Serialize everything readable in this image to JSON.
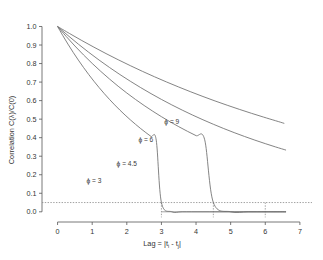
{
  "chart_data": {
    "type": "line",
    "title": "",
    "xlabel": "Lag = |t i - t j|",
    "xlabel_parts": {
      "lead": "Lag = |t",
      "sub1": "i",
      "mid": " - t",
      "sub2": "j",
      "tail": "|"
    },
    "ylabel": "Correlation C(λ)/C(0)",
    "xlim": [
      -0.45,
      7.35
    ],
    "ylim": [
      -0.055,
      1.035
    ],
    "xticks": [
      0,
      1,
      2,
      3,
      4,
      5,
      6,
      7
    ],
    "xtick_labels": [
      "0",
      "1",
      "2",
      "3",
      "4",
      "5",
      "6",
      "7"
    ],
    "yticks": [
      0.0,
      0.1,
      0.2,
      0.3,
      0.4,
      0.5,
      0.6,
      0.7,
      0.8,
      0.9,
      1.0
    ],
    "ytick_labels": [
      "0.0",
      "0.1",
      "0.2",
      "0.3",
      "0.4",
      "0.5",
      "0.6",
      "0.7",
      "0.8",
      "0.9",
      "1.0"
    ],
    "grid": false,
    "legend": "inline-annotations",
    "legend_position": "inline",
    "line_color": "#6e6e6e",
    "axis_color": "#555555",
    "guide_color": "#8a8a8a",
    "background": "#ffffff",
    "threshold": {
      "value": 0.05,
      "style": "dotted",
      "label": ""
    },
    "zero_baseline": {
      "value": 0.0,
      "x_from": 3.0,
      "x_to": 6.6,
      "style": "solid"
    },
    "drop_lines": [
      {
        "x": 3.0,
        "from": 0.05,
        "to": -0.03
      },
      {
        "x": 4.5,
        "from": 0.05,
        "to": -0.03
      },
      {
        "x": 6.0,
        "from": 0.05,
        "to": -0.03
      }
    ],
    "series": [
      {
        "name": "ϕ = 3",
        "phi": 3,
        "label": "ϕ = 3",
        "label_x": 1.05,
        "label_y": 0.155,
        "range_at_threshold": 3.0,
        "x": [
          0,
          0.15,
          0.3,
          0.45,
          0.6,
          0.75,
          0.9,
          1.05,
          1.2,
          1.35,
          1.5,
          1.65,
          1.8,
          1.95,
          2.1,
          2.25,
          2.4,
          2.55,
          2.7,
          2.85,
          3.0,
          3.3,
          3.6,
          4.2,
          5.0,
          6.0,
          6.6
        ],
        "values": [
          1.0,
          0.9512,
          0.9048,
          0.8607,
          0.8187,
          0.7788,
          0.7408,
          0.7047,
          0.6703,
          0.6376,
          0.6065,
          0.5769,
          0.5488,
          0.522,
          0.4966,
          0.4724,
          0.4493,
          0.4274,
          0.4066,
          0.3867,
          0.05,
          0.0,
          0.0,
          0.0,
          0.0,
          0.0,
          0.0
        ]
      },
      {
        "name": "ϕ = 4.5",
        "phi": 4.5,
        "label": "ϕ = 4.5",
        "label_x": 2.0,
        "label_y": 0.245,
        "range_at_threshold": 4.5,
        "x": [
          0,
          0.25,
          0.5,
          0.75,
          1.0,
          1.25,
          1.5,
          1.75,
          2.0,
          2.25,
          2.5,
          2.75,
          3.0,
          3.25,
          3.5,
          3.75,
          4.0,
          4.25,
          4.5,
          5.0,
          5.5,
          6.0,
          6.6
        ],
        "values": [
          1.0,
          0.946,
          0.8949,
          0.8465,
          0.8007,
          0.7574,
          0.7165,
          0.6777,
          0.6411,
          0.6065,
          0.5738,
          0.5428,
          0.5134,
          0.4857,
          0.4594,
          0.4346,
          0.4111,
          0.3888,
          0.05,
          0.0,
          0.0,
          0.0,
          0.0
        ]
      },
      {
        "name": "ϕ = 6",
        "phi": 6,
        "label": "ϕ = 6",
        "label_x": 2.55,
        "label_y": 0.375,
        "range_at_threshold": 5.5,
        "x": [
          0,
          0.3,
          0.6,
          0.9,
          1.2,
          1.5,
          1.8,
          2.1,
          2.4,
          2.7,
          3.0,
          3.3,
          3.6,
          3.9,
          4.2,
          4.5,
          4.8,
          5.1,
          5.4,
          5.7,
          6.0,
          6.3,
          6.6
        ],
        "values": [
          1.0,
          0.9512,
          0.9048,
          0.8607,
          0.8187,
          0.7788,
          0.7408,
          0.7047,
          0.6703,
          0.6376,
          0.6065,
          0.5769,
          0.5488,
          0.522,
          0.4966,
          0.4724,
          0.4493,
          0.4274,
          0.4066,
          0.3867,
          0.3679,
          0.3499,
          0.3329
        ]
      },
      {
        "name": "ϕ = 9",
        "phi": 9,
        "label": "ϕ = 9",
        "label_x": 3.3,
        "label_y": 0.475,
        "range_at_threshold": 6.0,
        "x": [
          0,
          0.35,
          0.7,
          1.05,
          1.4,
          1.75,
          2.1,
          2.45,
          2.8,
          3.15,
          3.5,
          3.85,
          4.2,
          4.55,
          4.9,
          5.25,
          5.6,
          5.95,
          6.3,
          6.55
        ],
        "values": [
          1.0,
          0.9616,
          0.9243,
          0.8884,
          0.8538,
          0.8206,
          0.7887,
          0.7581,
          0.7286,
          0.7004,
          0.6733,
          0.6472,
          0.6222,
          0.5981,
          0.5751,
          0.5529,
          0.5316,
          0.5111,
          0.4914,
          0.4771
        ]
      }
    ]
  }
}
